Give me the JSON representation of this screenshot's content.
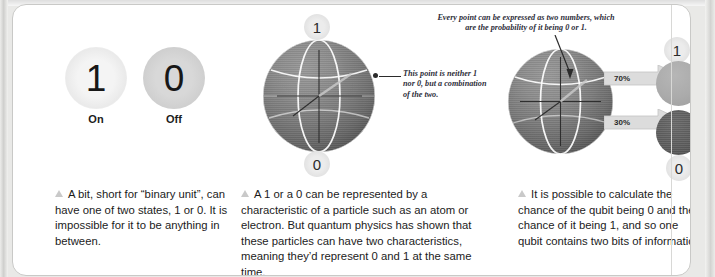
{
  "panels": {
    "bit": {
      "on": {
        "digit": "1",
        "label": "On"
      },
      "off": {
        "digit": "0",
        "label": "Off"
      },
      "body": "A bit, short for “binary unit”, can have one of two states, 1 or 0. It is impossible for it to be anything in between."
    },
    "qubit": {
      "pole_top": "1",
      "pole_bottom": "0",
      "callout": "This point is neither 1 nor 0, but a combination of the two.",
      "body": "A 1 or a 0 can be represented by a characteristic of a particle such as an atom or electron. But quantum physics has shown that these particles can have two characteristics, meaning they’d represent 0 and 1 at the same time."
    },
    "probability": {
      "callout": "Every point can be expressed as two numbers, which are the probability of it being 0 or 1.",
      "outcome_one": {
        "label": "1",
        "percent": "70%"
      },
      "outcome_zero": {
        "label": "0",
        "percent": "30%"
      },
      "body": "It is possible to calculate the chance of the qubit being 0 and the chance of it being 1, and so one qubit contains two bits of information."
    }
  },
  "colors": {
    "page_background": "#ffffff",
    "frame": "#e9e9e7",
    "sphere_light": "#9a9a9a",
    "sphere_dark": "#454545",
    "grid_line": "#ffffff",
    "axis_line": "#2b2b2b",
    "disc_one": "#ababab",
    "disc_zero": "#5e5e5e",
    "arrow_fill": "#d9d9d9",
    "text": "#1b1b1b",
    "callout_text": "#2e2e3a"
  }
}
